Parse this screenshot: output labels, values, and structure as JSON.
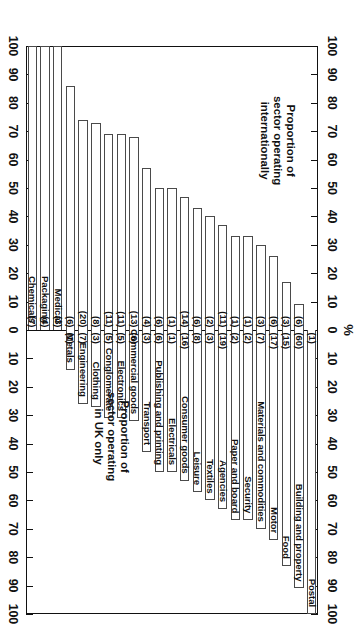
{
  "chart_data": {
    "type": "bar",
    "subtype": "diverging-stacked-horizontal",
    "title": "",
    "xlabel": "%",
    "ylabel": "",
    "xlim": [
      -100,
      100
    ],
    "xticks": [
      100,
      90,
      80,
      70,
      60,
      50,
      40,
      30,
      20,
      10,
      0,
      10,
      20,
      30,
      40,
      50,
      60,
      70,
      80,
      90,
      100
    ],
    "grid": false,
    "legend_position": "in-plot-annotations",
    "axis_unit_symbol": "%",
    "annotations": [
      "Proportion of\nsector operating\ninternationally",
      "Proportion of\nsector operating\nin UK only"
    ],
    "series": [
      {
        "name": "Proportion of sector operating internationally",
        "side": "left"
      },
      {
        "name": "Proportion of sector operating in UK only",
        "side": "right"
      }
    ],
    "categories": [
      "Postal",
      "Building and property",
      "Food",
      "Motor",
      "Materials and commodities",
      "Security",
      "Paper and board",
      "Agencies",
      "Textiles",
      "Leisure",
      "Consumer goods",
      "Electricals",
      "Publishing and printing",
      "Transport",
      "Commercial goods",
      "Electronics",
      "Conglomerate",
      "Clothing",
      "Engineering",
      "Metals",
      "Medical",
      "Packaging",
      "Chemicals"
    ],
    "rows": [
      {
        "category": "Postal",
        "international_pct": 0,
        "uk_only_pct": 100,
        "international_count": "",
        "uk_only_count": "(1)",
        "label_overflow": false
      },
      {
        "category": "Building and property",
        "international_pct": 9,
        "uk_only_pct": 91,
        "international_count": "(6)",
        "uk_only_count": "(60)",
        "label_overflow": false
      },
      {
        "category": "Food",
        "international_pct": 17,
        "uk_only_pct": 83,
        "international_count": "(3)",
        "uk_only_count": "(15)",
        "label_overflow": false
      },
      {
        "category": "Motor",
        "international_pct": 26,
        "uk_only_pct": 74,
        "international_count": "(6)",
        "uk_only_count": "(17)",
        "label_overflow": false
      },
      {
        "category": "Materials and commodities",
        "international_pct": 30,
        "uk_only_pct": 70,
        "international_count": "(3)",
        "uk_only_count": "(7)",
        "label_overflow": false
      },
      {
        "category": "Security",
        "international_pct": 33,
        "uk_only_pct": 67,
        "international_count": "(1)",
        "uk_only_count": "(2)",
        "label_overflow": false
      },
      {
        "category": "Paper and board",
        "international_pct": 33,
        "uk_only_pct": 67,
        "international_count": "(1)",
        "uk_only_count": "(2)",
        "label_overflow": false
      },
      {
        "category": "Agencies",
        "international_pct": 37,
        "uk_only_pct": 63,
        "international_count": "(11)",
        "uk_only_count": "(19)",
        "label_overflow": false
      },
      {
        "category": "Textiles",
        "international_pct": 40,
        "uk_only_pct": 60,
        "international_count": "(2)",
        "uk_only_count": "(3)",
        "label_overflow": false
      },
      {
        "category": "Leisure",
        "international_pct": 43,
        "uk_only_pct": 57,
        "international_count": "(6)",
        "uk_only_count": "(8)",
        "label_overflow": false
      },
      {
        "category": "Consumer goods",
        "international_pct": 47,
        "uk_only_pct": 53,
        "international_count": "(14)",
        "uk_only_count": "(16)",
        "label_overflow": true
      },
      {
        "category": "Electricals",
        "international_pct": 50,
        "uk_only_pct": 50,
        "international_count": "(1)",
        "uk_only_count": "(1)",
        "label_overflow": false
      },
      {
        "category": "Publishing and printing",
        "international_pct": 50,
        "uk_only_pct": 50,
        "international_count": "(6)",
        "uk_only_count": "(6)",
        "label_overflow": true
      },
      {
        "category": "Transport",
        "international_pct": 57,
        "uk_only_pct": 43,
        "international_count": "(4)",
        "uk_only_count": "(3)",
        "label_overflow": true
      },
      {
        "category": "Commercial goods",
        "international_pct": 68,
        "uk_only_pct": 32,
        "international_count": "(13)",
        "uk_only_count": "(6)",
        "label_overflow": true
      },
      {
        "category": "Electronics",
        "international_pct": 69,
        "uk_only_pct": 31,
        "international_count": "(11)",
        "uk_only_count": "(5)",
        "label_overflow": true
      },
      {
        "category": "Conglomerate",
        "international_pct": 69,
        "uk_only_pct": 31,
        "international_count": "(11)",
        "uk_only_count": "(5)",
        "label_overflow": true
      },
      {
        "category": "Clothing",
        "international_pct": 73,
        "uk_only_pct": 27,
        "international_count": "(8)",
        "uk_only_count": "(3)",
        "label_overflow": true
      },
      {
        "category": "Engineering",
        "international_pct": 74,
        "uk_only_pct": 26,
        "international_count": "(20)",
        "uk_only_count": "(7)",
        "label_overflow": true
      },
      {
        "category": "Metals",
        "international_pct": 86,
        "uk_only_pct": 14,
        "international_count": "(6)",
        "uk_only_count": "(1)",
        "label_overflow": true
      },
      {
        "category": "Medical",
        "international_pct": 100,
        "uk_only_pct": 0,
        "international_count": "(3)",
        "uk_only_count": "",
        "label_overflow": true
      },
      {
        "category": "Packaging",
        "international_pct": 100,
        "uk_only_pct": 0,
        "international_count": "(4)",
        "uk_only_count": "",
        "label_overflow": true
      },
      {
        "category": "Chemicals",
        "international_pct": 100,
        "uk_only_pct": 0,
        "international_count": "(7)",
        "uk_only_count": "",
        "label_overflow": true
      }
    ]
  },
  "axis": {
    "percent_symbol": "%",
    "tick_labels_left_to_right": [
      "100",
      "90",
      "80",
      "70",
      "60",
      "50",
      "40",
      "30",
      "20",
      "10",
      "0",
      "10",
      "20",
      "30",
      "40",
      "50",
      "60",
      "70",
      "80",
      "90",
      "100"
    ]
  },
  "annotations": {
    "international": "Proportion of\nsector operating\ninternationally",
    "uk_only": "Proportion of\nsector operating\nin UK only"
  }
}
